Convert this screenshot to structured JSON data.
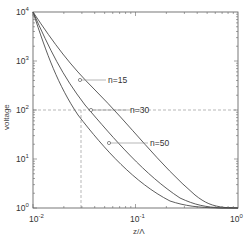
{
  "chart_data": {
    "type": "line",
    "title": "",
    "xlabel": "z/Λ",
    "ylabel": "voltage",
    "xscale": "log",
    "yscale": "log",
    "xlim": [
      0.01,
      1
    ],
    "ylim": [
      1,
      10000
    ],
    "x_ticks": [
      {
        "base": "10",
        "exp": "-2"
      },
      {
        "base": "10",
        "exp": "-1"
      },
      {
        "base": "10",
        "exp": "0"
      }
    ],
    "y_ticks": [
      {
        "base": "10",
        "exp": "0"
      },
      {
        "base": "10",
        "exp": "1"
      },
      {
        "base": "10",
        "exp": "2"
      },
      {
        "base": "10",
        "exp": "3"
      },
      {
        "base": "10",
        "exp": "4"
      }
    ],
    "grid": false,
    "series": [
      {
        "name": "n=15",
        "x": [
          0.01,
          0.015,
          0.02,
          0.03,
          0.05,
          0.1,
          0.2,
          0.4,
          0.7,
          1.0
        ],
        "y": [
          10000,
          2900,
          1200,
          420,
          120,
          25,
          6,
          1.6,
          1.0,
          1.0
        ]
      },
      {
        "name": "n=30",
        "x": [
          0.01,
          0.015,
          0.02,
          0.03,
          0.05,
          0.1,
          0.2,
          0.4,
          0.7,
          1.0
        ],
        "y": [
          10000,
          1900,
          700,
          200,
          55,
          11,
          3,
          1.2,
          1.0,
          1.0
        ]
      },
      {
        "name": "n=50",
        "x": [
          0.01,
          0.015,
          0.02,
          0.03,
          0.05,
          0.1,
          0.2,
          0.4,
          0.7,
          1.0
        ],
        "y": [
          10000,
          1400,
          450,
          120,
          32,
          7,
          2,
          1.1,
          1.0,
          1.0
        ]
      }
    ],
    "annotations": [
      {
        "text": "n=15",
        "marker_x": 0.029,
        "marker_y": 400
      },
      {
        "text": "n=30",
        "marker_x": 0.035,
        "marker_y": 100
      },
      {
        "text": "n=50",
        "marker_x": 0.052,
        "marker_y": 22
      }
    ],
    "reference_lines": {
      "vertical_x": 0.03,
      "horizontal_y": 100,
      "style": "dashed"
    }
  }
}
